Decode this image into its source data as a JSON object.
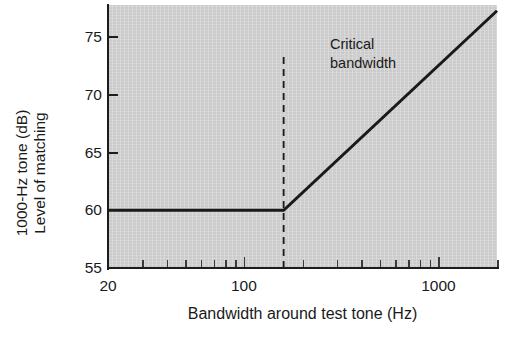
{
  "chart_data": {
    "type": "line",
    "title": "",
    "xlabel": "Bandwidth around test tone (Hz)",
    "ylabel_lines": [
      "Level of matching",
      "1000-Hz tone (dB)"
    ],
    "ylabel": "Level of matching 1000-Hz tone (dB)",
    "xscale": "log",
    "xlim": [
      20,
      2000
    ],
    "ylim": [
      55,
      77.8
    ],
    "grid": false,
    "legend": "none",
    "xticks_labeled": [
      {
        "value": 20,
        "label": "20"
      },
      {
        "value": 100,
        "label": "100"
      },
      {
        "value": 1000,
        "label": "1000"
      }
    ],
    "xticks_minor": [
      30,
      40,
      50,
      60,
      70,
      80,
      90,
      200,
      300,
      400,
      500,
      600,
      700,
      800,
      900,
      2000
    ],
    "yticks": [
      {
        "value": 55,
        "label": "55"
      },
      {
        "value": 60,
        "label": "60"
      },
      {
        "value": 65,
        "label": "65"
      },
      {
        "value": 70,
        "label": "70"
      },
      {
        "value": 75,
        "label": "75"
      }
    ],
    "series": [
      {
        "name": "Level of matching 1000-Hz tone",
        "x": [
          20,
          160,
          2000
        ],
        "y": [
          60.0,
          60.0,
          77.3
        ],
        "color": "#1a1a1a",
        "linewidth": 3
      }
    ],
    "annotations": [
      {
        "text_lines": [
          "Critical",
          "bandwidth"
        ],
        "text": "Critical bandwidth",
        "x": 160,
        "marker": "dashed-vertical-line",
        "line_from_y": 55,
        "line_to_y": 73.5,
        "color": "#1a1a1a"
      }
    ],
    "plot_background_color": "#d2d2d2",
    "figure_background_color": "#ffffff"
  }
}
